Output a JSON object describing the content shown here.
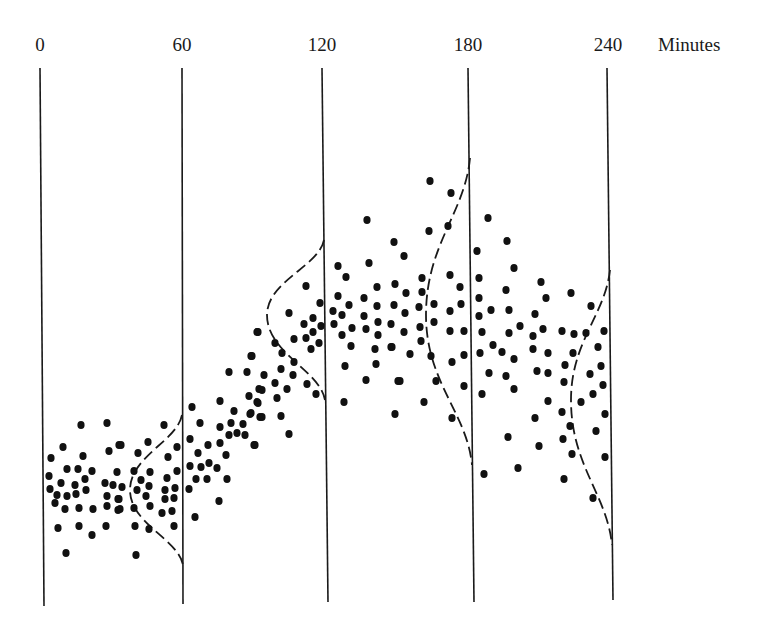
{
  "chart_data": {
    "type": "scatter",
    "title": "",
    "xlabel": "Minutes",
    "ylabel": "",
    "grid": false,
    "legend": null,
    "time_markers": [
      {
        "label": "0",
        "x_top": 40,
        "x_bottom": 44,
        "y_top": 68,
        "y_bottom": 606
      },
      {
        "label": "60",
        "x_top": 182,
        "x_bottom": 183,
        "y_top": 68,
        "y_bottom": 604
      },
      {
        "label": "120",
        "x_top": 322,
        "x_bottom": 328,
        "y_top": 68,
        "y_bottom": 602
      },
      {
        "label": "180",
        "x_top": 468,
        "x_bottom": 474,
        "y_top": 68,
        "y_bottom": 602
      },
      {
        "label": "240",
        "x_top": 607,
        "x_bottom": 613,
        "y_top": 68,
        "y_bottom": 600
      }
    ],
    "unit_label": "Minutes",
    "distribution_curves": [
      {
        "at": "60",
        "top": [
          182,
          415
        ],
        "apex": [
          130,
          490
        ],
        "bottom": [
          183,
          565
        ]
      },
      {
        "at": "120",
        "top": [
          324,
          240
        ],
        "apex": [
          267,
          315
        ],
        "bottom": [
          325,
          400
        ]
      },
      {
        "at": "180",
        "top": [
          470,
          158
        ],
        "apex": [
          426,
          315
        ],
        "bottom": [
          472,
          465
        ]
      },
      {
        "at": "240",
        "top": [
          610,
          270
        ],
        "apex": [
          571,
          400
        ],
        "bottom": [
          612,
          545
        ]
      }
    ],
    "annotations": "Scatter of observations over time with dashed normal-distribution curves drawn at 60, 120, 180 and 240 minutes; spread widens and mean rises then falls.",
    "points": [
      [
        81,
        425
      ],
      [
        107,
        423
      ],
      [
        63,
        447
      ],
      [
        51,
        458
      ],
      [
        83,
        456
      ],
      [
        109,
        451
      ],
      [
        119,
        445
      ],
      [
        49,
        476
      ],
      [
        67,
        469
      ],
      [
        78,
        469
      ],
      [
        92,
        471
      ],
      [
        85,
        479
      ],
      [
        117,
        472
      ],
      [
        50,
        489
      ],
      [
        61,
        483
      ],
      [
        75,
        485
      ],
      [
        86,
        490
      ],
      [
        105,
        483
      ],
      [
        113,
        485
      ],
      [
        57,
        495
      ],
      [
        67,
        496
      ],
      [
        76,
        494
      ],
      [
        107,
        496
      ],
      [
        118,
        499
      ],
      [
        55,
        503
      ],
      [
        65,
        509
      ],
      [
        79,
        508
      ],
      [
        93,
        509
      ],
      [
        107,
        506
      ],
      [
        118,
        510
      ],
      [
        58,
        528
      ],
      [
        79,
        526
      ],
      [
        92,
        535
      ],
      [
        106,
        526
      ],
      [
        66,
        553
      ],
      [
        164,
        425
      ],
      [
        121,
        445
      ],
      [
        148,
        442
      ],
      [
        177,
        447
      ],
      [
        138,
        453
      ],
      [
        168,
        457
      ],
      [
        134,
        471
      ],
      [
        150,
        472
      ],
      [
        177,
        471
      ],
      [
        167,
        478
      ],
      [
        122,
        487
      ],
      [
        141,
        480
      ],
      [
        149,
        486
      ],
      [
        137,
        490
      ],
      [
        165,
        490
      ],
      [
        175,
        488
      ],
      [
        119,
        499
      ],
      [
        146,
        496
      ],
      [
        165,
        499
      ],
      [
        174,
        498
      ],
      [
        120,
        509
      ],
      [
        134,
        508
      ],
      [
        150,
        506
      ],
      [
        162,
        513
      ],
      [
        172,
        511
      ],
      [
        135,
        526
      ],
      [
        149,
        529
      ],
      [
        174,
        526
      ],
      [
        136,
        555
      ],
      [
        257,
        332
      ],
      [
        251,
        356
      ],
      [
        229,
        372
      ],
      [
        247,
        372
      ],
      [
        259,
        389
      ],
      [
        249,
        396
      ],
      [
        220,
        401
      ],
      [
        257,
        402
      ],
      [
        192,
        407
      ],
      [
        234,
        411
      ],
      [
        250,
        414
      ],
      [
        260,
        417
      ],
      [
        200,
        423
      ],
      [
        231,
        423
      ],
      [
        243,
        424
      ],
      [
        220,
        427
      ],
      [
        190,
        439
      ],
      [
        229,
        435
      ],
      [
        237,
        433
      ],
      [
        245,
        435
      ],
      [
        208,
        445
      ],
      [
        220,
        443
      ],
      [
        254,
        445
      ],
      [
        198,
        453
      ],
      [
        226,
        455
      ],
      [
        190,
        466
      ],
      [
        201,
        467
      ],
      [
        209,
        463
      ],
      [
        217,
        468
      ],
      [
        196,
        479
      ],
      [
        207,
        479
      ],
      [
        227,
        479
      ],
      [
        189,
        489
      ],
      [
        219,
        501
      ],
      [
        195,
        517
      ],
      [
        306,
        286
      ],
      [
        320,
        303
      ],
      [
        289,
        313
      ],
      [
        313,
        318
      ],
      [
        304,
        324
      ],
      [
        321,
        326
      ],
      [
        258,
        332
      ],
      [
        313,
        332
      ],
      [
        294,
        339
      ],
      [
        306,
        338
      ],
      [
        275,
        343
      ],
      [
        319,
        343
      ],
      [
        311,
        349
      ],
      [
        282,
        353
      ],
      [
        252,
        356
      ],
      [
        294,
        362
      ],
      [
        281,
        369
      ],
      [
        264,
        375
      ],
      [
        293,
        375
      ],
      [
        275,
        383
      ],
      [
        307,
        384
      ],
      [
        287,
        389
      ],
      [
        262,
        390
      ],
      [
        277,
        398
      ],
      [
        316,
        394
      ],
      [
        258,
        403
      ],
      [
        251,
        413
      ],
      [
        262,
        417
      ],
      [
        281,
        416
      ],
      [
        289,
        434
      ],
      [
        255,
        445
      ],
      [
        367,
        220
      ],
      [
        394,
        242
      ],
      [
        338,
        266
      ],
      [
        369,
        263
      ],
      [
        346,
        277
      ],
      [
        377,
        287
      ],
      [
        395,
        284
      ],
      [
        338,
        296
      ],
      [
        364,
        298
      ],
      [
        349,
        305
      ],
      [
        377,
        306
      ],
      [
        394,
        305
      ],
      [
        333,
        311
      ],
      [
        342,
        315
      ],
      [
        364,
        316
      ],
      [
        334,
        324
      ],
      [
        378,
        322
      ],
      [
        391,
        324
      ],
      [
        352,
        328
      ],
      [
        366,
        329
      ],
      [
        342,
        335
      ],
      [
        378,
        335
      ],
      [
        351,
        346
      ],
      [
        375,
        349
      ],
      [
        391,
        347
      ],
      [
        345,
        366
      ],
      [
        376,
        364
      ],
      [
        366,
        380
      ],
      [
        398,
        381
      ],
      [
        344,
        402
      ],
      [
        395,
        414
      ],
      [
        430,
        181
      ],
      [
        451,
        193
      ],
      [
        429,
        231
      ],
      [
        448,
        226
      ],
      [
        404,
        256
      ],
      [
        422,
        278
      ],
      [
        450,
        275
      ],
      [
        460,
        287
      ],
      [
        406,
        293
      ],
      [
        422,
        292
      ],
      [
        419,
        307
      ],
      [
        434,
        304
      ],
      [
        461,
        304
      ],
      [
        405,
        313
      ],
      [
        450,
        311
      ],
      [
        434,
        322
      ],
      [
        420,
        327
      ],
      [
        404,
        332
      ],
      [
        450,
        331
      ],
      [
        464,
        331
      ],
      [
        421,
        341
      ],
      [
        392,
        347
      ],
      [
        410,
        354
      ],
      [
        431,
        356
      ],
      [
        464,
        355
      ],
      [
        452,
        362
      ],
      [
        400,
        381
      ],
      [
        436,
        381
      ],
      [
        464,
        386
      ],
      [
        424,
        402
      ],
      [
        452,
        418
      ],
      [
        488,
        218
      ],
      [
        507,
        241
      ],
      [
        477,
        251
      ],
      [
        514,
        268
      ],
      [
        479,
        278
      ],
      [
        541,
        282
      ],
      [
        506,
        290
      ],
      [
        479,
        298
      ],
      [
        546,
        298
      ],
      [
        491,
        310
      ],
      [
        509,
        310
      ],
      [
        479,
        316
      ],
      [
        535,
        314
      ],
      [
        520,
        326
      ],
      [
        543,
        329
      ],
      [
        482,
        332
      ],
      [
        509,
        333
      ],
      [
        533,
        336
      ],
      [
        493,
        345
      ],
      [
        502,
        352
      ],
      [
        533,
        349
      ],
      [
        548,
        353
      ],
      [
        480,
        353
      ],
      [
        514,
        359
      ],
      [
        489,
        373
      ],
      [
        506,
        376
      ],
      [
        537,
        371
      ],
      [
        548,
        373
      ],
      [
        514,
        389
      ],
      [
        482,
        394
      ],
      [
        548,
        401
      ],
      [
        535,
        418
      ],
      [
        508,
        437
      ],
      [
        539,
        446
      ],
      [
        518,
        468
      ],
      [
        484,
        474
      ],
      [
        571,
        293
      ],
      [
        591,
        306
      ],
      [
        562,
        331
      ],
      [
        574,
        334
      ],
      [
        586,
        333
      ],
      [
        604,
        331
      ],
      [
        573,
        353
      ],
      [
        598,
        347
      ],
      [
        565,
        365
      ],
      [
        601,
        366
      ],
      [
        590,
        374
      ],
      [
        564,
        382
      ],
      [
        603,
        385
      ],
      [
        593,
        394
      ],
      [
        581,
        402
      ],
      [
        562,
        412
      ],
      [
        605,
        414
      ],
      [
        570,
        426
      ],
      [
        596,
        431
      ],
      [
        563,
        439
      ],
      [
        572,
        454
      ],
      [
        605,
        457
      ],
      [
        564,
        479
      ],
      [
        593,
        498
      ]
    ]
  }
}
